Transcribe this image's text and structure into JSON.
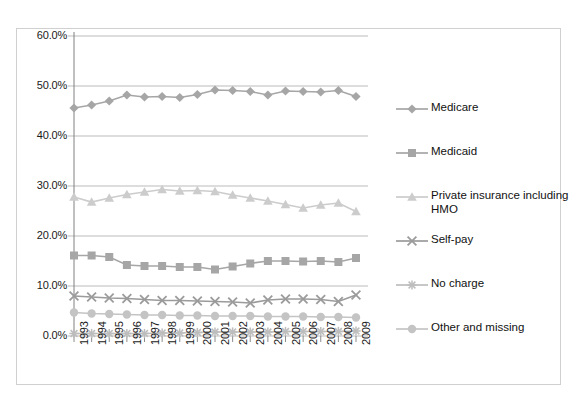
{
  "chart_title_partial": "",
  "chart_data": {
    "type": "line",
    "title": "",
    "subtitle": "",
    "xlabel": "",
    "ylabel": "",
    "x": [
      1993,
      1994,
      1995,
      1996,
      1997,
      1998,
      1999,
      2000,
      2001,
      2002,
      2003,
      2004,
      2005,
      2006,
      2007,
      2008,
      2009
    ],
    "categories": [
      "1993",
      "1994",
      "1995",
      "1996",
      "1997",
      "1998",
      "1999",
      "2000",
      "2001",
      "2002",
      "2003",
      "2004",
      "2005",
      "2006",
      "2007",
      "2008",
      "2009"
    ],
    "ylim": [
      0,
      60
    ],
    "ytick_values": [
      0,
      10,
      20,
      30,
      40,
      50,
      60
    ],
    "ytick_labels": [
      "0.0%",
      "10.0%",
      "20.0%",
      "30.0%",
      "40.0%",
      "50.0%",
      "60.0%"
    ],
    "grid": true,
    "grid_axis": "y",
    "legend_position": "right",
    "series": [
      {
        "name": "Medicare",
        "marker": "diamond",
        "color": "#a6a6a6",
        "values": [
          45.6,
          46.2,
          47.0,
          48.2,
          47.8,
          47.9,
          47.7,
          48.3,
          49.2,
          49.1,
          48.9,
          48.2,
          49.0,
          48.9,
          48.8,
          49.1,
          47.9
        ]
      },
      {
        "name": "Medicaid",
        "marker": "square",
        "color": "#a6a6a6",
        "values": [
          16.1,
          16.1,
          15.8,
          14.2,
          14.0,
          14.0,
          13.8,
          13.8,
          13.3,
          13.9,
          14.5,
          15.0,
          15.0,
          14.9,
          15.0,
          14.8,
          15.6
        ]
      },
      {
        "name": "Private insurance including HMO",
        "marker": "triangle",
        "color": "#cccccc",
        "values": [
          27.8,
          26.8,
          27.6,
          28.3,
          28.8,
          29.3,
          29.0,
          29.1,
          28.9,
          28.2,
          27.6,
          27.0,
          26.3,
          25.6,
          26.2,
          26.6,
          24.9
        ]
      },
      {
        "name": "Self-pay",
        "marker": "x",
        "color": "#9b9b9b",
        "values": [
          8.0,
          7.8,
          7.6,
          7.5,
          7.3,
          7.1,
          7.1,
          7.0,
          6.9,
          6.8,
          6.6,
          7.2,
          7.4,
          7.4,
          7.3,
          6.9,
          8.2
        ]
      },
      {
        "name": "No charge",
        "marker": "star",
        "color": "#bdbdbd",
        "values": [
          0.5,
          0.5,
          0.5,
          0.5,
          0.5,
          0.6,
          0.6,
          0.7,
          0.8,
          0.8,
          0.8,
          0.8,
          0.9,
          0.9,
          0.9,
          0.9,
          1.0
        ]
      },
      {
        "name": "Other and missing",
        "marker": "circle",
        "color": "#c4c4c4",
        "values": [
          4.7,
          4.5,
          4.4,
          4.3,
          4.2,
          4.2,
          4.1,
          4.1,
          4.0,
          4.0,
          4.0,
          3.9,
          3.9,
          3.9,
          3.8,
          3.8,
          3.7
        ]
      }
    ]
  }
}
